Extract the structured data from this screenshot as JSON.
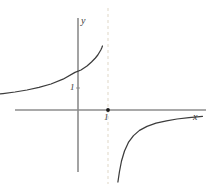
{
  "figure": {
    "title": "",
    "width": 217,
    "height": 185,
    "background_color": "#ffffff"
  },
  "labels": {
    "y_axis": "y",
    "x_axis": "x",
    "y_tick_1": "1",
    "x_tick_1": "1"
  },
  "colors": {
    "axis": "#808080",
    "curve": "#3c3c3c",
    "asymptote": "#e8e3d8",
    "point": "#1a1a1a",
    "text": "#3a3a3a"
  },
  "chart_data": {
    "type": "line",
    "title": "",
    "xlabel": "x",
    "ylabel": "y",
    "grid": false,
    "legend": "none",
    "xlim": [
      -4.1,
      4.3
    ],
    "ylim": [
      -3.2,
      3.3
    ],
    "axis_origin_px": {
      "x": 78,
      "y": 110
    },
    "unit_px": {
      "x": 30,
      "y": 20
    },
    "asymptotes": [
      {
        "kind": "vertical",
        "value": 1,
        "style": "dashed",
        "color": "#e8e3d8"
      },
      {
        "kind": "horizontal",
        "value": 0,
        "style": "implicit"
      }
    ],
    "annotations": [
      {
        "text": "1",
        "x": 0,
        "y": 1,
        "position": "left-of-y-axis"
      },
      {
        "text": "1",
        "x": 1,
        "y": 0,
        "position": "below-x-axis"
      },
      {
        "text": "y",
        "x": 0,
        "y": 3.1,
        "position": "axis-tip"
      },
      {
        "text": "x",
        "x": 4.1,
        "y": -0.2,
        "position": "axis-tip"
      }
    ],
    "points": [
      {
        "label": "",
        "x": 1,
        "y": 0,
        "marker": "filled-dot"
      }
    ],
    "series": [
      {
        "name": "left-branch",
        "comment": "rises from y~0+ at far left to +infinity as x -> 1-",
        "x": [
          -4.1,
          -3.7,
          -3.3,
          -2.9,
          -2.5,
          -2.1,
          -1.7,
          -1.3,
          -0.9,
          -0.5,
          -0.1,
          0.1,
          0.3,
          0.45,
          0.58,
          0.66,
          0.72,
          0.76,
          0.79,
          0.815
        ],
        "y": [
          0.6,
          0.64,
          0.69,
          0.75,
          0.82,
          0.9,
          1.0,
          1.13,
          1.3,
          1.54,
          1.88,
          2.0,
          2.2,
          2.4,
          2.6,
          2.75,
          2.9,
          3.0,
          3.1,
          3.2
        ]
      },
      {
        "name": "right-branch",
        "comment": "descends from just right of x=1 toward y~0- as x -> +infinity",
        "x": [
          1.33,
          1.38,
          1.45,
          1.55,
          1.68,
          1.85,
          2.05,
          2.3,
          2.6,
          2.95,
          3.3,
          3.7,
          4.15
        ],
        "y": [
          -3.6,
          -3.1,
          -2.55,
          -2.05,
          -1.62,
          -1.28,
          -1.02,
          -0.82,
          -0.66,
          -0.54,
          -0.45,
          -0.38,
          -0.32
        ]
      }
    ]
  }
}
